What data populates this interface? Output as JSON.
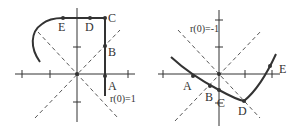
{
  "figure": {
    "left_panel": {
      "annotation": "r(0)=1",
      "points": [
        {
          "label": "A",
          "x": 105,
          "y": 76,
          "lx": 108,
          "ly": 90
        },
        {
          "label": "B",
          "x": 105,
          "y": 46,
          "lx": 108,
          "ly": 56
        },
        {
          "label": "C",
          "x": 105,
          "y": 18,
          "lx": 108,
          "ly": 22
        },
        {
          "label": "D",
          "x": 90,
          "y": 18,
          "lx": 85,
          "ly": 31
        },
        {
          "label": "E",
          "x": 63,
          "y": 18,
          "lx": 58,
          "ly": 31
        }
      ]
    },
    "right_panel": {
      "annotation": "r(0)=-1",
      "points": [
        {
          "label": "A",
          "x": 193,
          "y": 76,
          "lx": 183,
          "ly": 90
        },
        {
          "label": "B",
          "x": 210,
          "y": 86,
          "lx": 205,
          "ly": 101
        },
        {
          "label": "C",
          "x": 219,
          "y": 90,
          "lx": 218,
          "ly": 107
        },
        {
          "label": "D",
          "x": 244,
          "y": 101,
          "lx": 238,
          "ly": 115
        },
        {
          "label": "E",
          "x": 270,
          "y": 66,
          "lx": 279,
          "ly": 73
        }
      ]
    }
  }
}
